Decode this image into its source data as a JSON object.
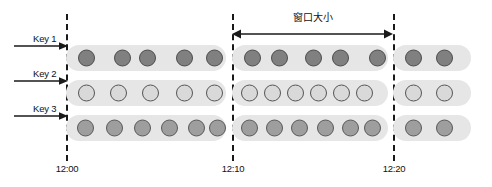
{
  "diagram": {
    "window_annotation": {
      "label": "窗口大小",
      "start_time": "12:10",
      "end_time": "12:20",
      "arrow_style": "double-headed"
    },
    "timeline": {
      "boundaries": [
        {
          "label": "12:00",
          "x": 66
        },
        {
          "label": "12:10",
          "x": 232
        },
        {
          "label": "12:20",
          "x": 393
        }
      ],
      "line_style": "dashed"
    },
    "colors": {
      "capsule_fill": "#e6e6e6",
      "key1_dot_fill": "#808080",
      "key1_dot_stroke": "#4d4d4d",
      "key2_dot_fill": "#d9d9d9",
      "key2_dot_stroke": "#555555",
      "key3_dot_fill": "#9e9e9e",
      "key3_dot_stroke": "#5a5a5a",
      "line_color": "#1a1a1a",
      "text_color": "#111111",
      "background": "#ffffff"
    },
    "rows": [
      {
        "key_label": "Key 1",
        "row_y": 45,
        "dot_fill": "#808080",
        "dot_stroke": "#4d4d4d",
        "segments": [
          {
            "segment_name": "before-window",
            "x": 66,
            "width": 160,
            "event_count": 5,
            "event_offsets": [
              12,
              48,
              73,
              110,
              140
            ]
          },
          {
            "segment_name": "inside-window",
            "x": 232,
            "width": 156,
            "event_count": 5,
            "event_offsets": [
              12,
              39,
              73,
              100,
              137
            ]
          },
          {
            "segment_name": "after-window",
            "x": 393,
            "width": 78,
            "event_count": 2,
            "event_offsets": [
              12,
              43
            ]
          }
        ]
      },
      {
        "key_label": "Key 2",
        "row_y": 80,
        "dot_fill": "#d9d9d9",
        "dot_stroke": "#555555",
        "segments": [
          {
            "segment_name": "before-window",
            "x": 66,
            "width": 160,
            "event_count": 5,
            "event_offsets": [
              12,
              44,
              76,
              110,
              140
            ]
          },
          {
            "segment_name": "inside-window",
            "x": 232,
            "width": 156,
            "event_count": 6,
            "event_offsets": [
              9,
              32,
              55,
              78,
              101,
              124
            ]
          },
          {
            "segment_name": "after-window",
            "x": 393,
            "width": 78,
            "event_count": 2,
            "event_offsets": [
              12,
              43
            ]
          }
        ]
      },
      {
        "key_label": "Key 3",
        "row_y": 115,
        "dot_fill": "#9e9e9e",
        "dot_stroke": "#5a5a5a",
        "segments": [
          {
            "segment_name": "before-window",
            "x": 66,
            "width": 160,
            "event_count": 6,
            "event_offsets": [
              11,
              40,
              68,
              95,
              122,
              143
            ]
          },
          {
            "segment_name": "inside-window",
            "x": 232,
            "width": 156,
            "event_count": 6,
            "event_offsets": [
              9,
              34,
              59,
              85,
              110,
              132
            ]
          },
          {
            "segment_name": "after-window",
            "x": 393,
            "width": 78,
            "event_count": 2,
            "event_offsets": [
              12,
              43
            ]
          }
        ]
      }
    ]
  }
}
